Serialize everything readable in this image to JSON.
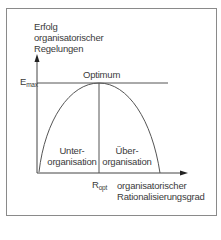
{
  "diagram": {
    "y_axis_label": [
      "Erfolg",
      "organisatorischer",
      "Regelungen"
    ],
    "x_axis_label": [
      "organisatorischer",
      "Rationalisierungsgrad"
    ],
    "emax": {
      "main": "E",
      "sub": "max"
    },
    "ropt": {
      "main": "R",
      "sub": "opt"
    },
    "peak_label": "Optimum",
    "left_region": [
      "Unter-",
      "organisation"
    ],
    "right_region": [
      "Über-",
      "organisation"
    ],
    "colors": {
      "line": "#555555",
      "text": "#3a3a3a",
      "frame": "#8a8a8a"
    }
  }
}
